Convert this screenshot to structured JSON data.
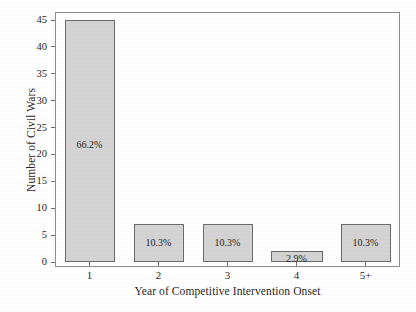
{
  "chart_data": {
    "type": "bar",
    "title": "",
    "subtitle": "",
    "xlabel": "Year of Competitive Intervention Onset",
    "ylabel": "Number of Civil Wars",
    "categories": [
      "1",
      "2",
      "3",
      "4",
      "5+"
    ],
    "values": [
      45,
      7,
      7,
      2,
      7
    ],
    "data_labels": [
      "66.2%",
      "10.3%",
      "10.3%",
      "2.9%",
      "10.3%"
    ],
    "ylim": [
      0,
      45
    ],
    "yticks": [
      0,
      5,
      10,
      15,
      20,
      25,
      30,
      35,
      40,
      45
    ],
    "ytick_labels": [
      "0",
      "5",
      "10",
      "15",
      "20",
      "25",
      "30",
      "35",
      "40",
      "45"
    ],
    "grid": false,
    "legend": null,
    "series": [
      {
        "name": "Number of Civil Wars",
        "values": [
          45,
          7,
          7,
          2,
          7
        ],
        "labels": [
          "66.2%",
          "10.3%",
          "10.3%",
          "2.9%",
          "10.3%"
        ]
      }
    ],
    "colors": {
      "bar_fill": "#d3d3d3",
      "bar_edge": "#6a6a6a",
      "axis": "#8d8d8d",
      "text": "#272727",
      "background": "#ffffff"
    }
  }
}
